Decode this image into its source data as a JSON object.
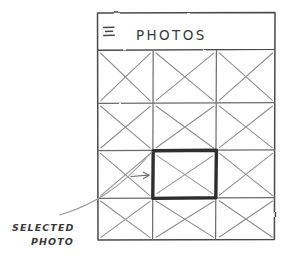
{
  "sketch": {
    "kind": "hand-drawn-wireframe",
    "background": "#ffffff",
    "ink_color": "#555555",
    "bold_ink_color": "#333333"
  },
  "app_window": {
    "frame": {
      "x": 97,
      "y": 12,
      "width": 178,
      "height": 228
    },
    "header": {
      "menu_icon": "hamburger-menu-icon",
      "title": "PHOTOS",
      "divider_y": 50
    },
    "grid": {
      "columns": 3,
      "rows": 4,
      "cell_placeholder_icon": "image-placeholder-cross",
      "column_edges": [
        97,
        153,
        216,
        275
      ],
      "row_edges": [
        50,
        103,
        150,
        198,
        240
      ],
      "cells": [
        {
          "row": 1,
          "col": 1,
          "selected": false
        },
        {
          "row": 1,
          "col": 2,
          "selected": false
        },
        {
          "row": 1,
          "col": 3,
          "selected": false
        },
        {
          "row": 2,
          "col": 1,
          "selected": false
        },
        {
          "row": 2,
          "col": 2,
          "selected": false
        },
        {
          "row": 2,
          "col": 3,
          "selected": false
        },
        {
          "row": 3,
          "col": 1,
          "selected": false
        },
        {
          "row": 3,
          "col": 2,
          "selected": true
        },
        {
          "row": 3,
          "col": 3,
          "selected": false
        },
        {
          "row": 4,
          "col": 1,
          "selected": false
        },
        {
          "row": 4,
          "col": 2,
          "selected": false
        },
        {
          "row": 4,
          "col": 3,
          "selected": false
        }
      ]
    }
  },
  "annotation": {
    "line1": "SELECTED",
    "line2": "PHOTO",
    "leader_line": "curved-leader-line",
    "pointer_arrow": "arrow-right-icon"
  }
}
